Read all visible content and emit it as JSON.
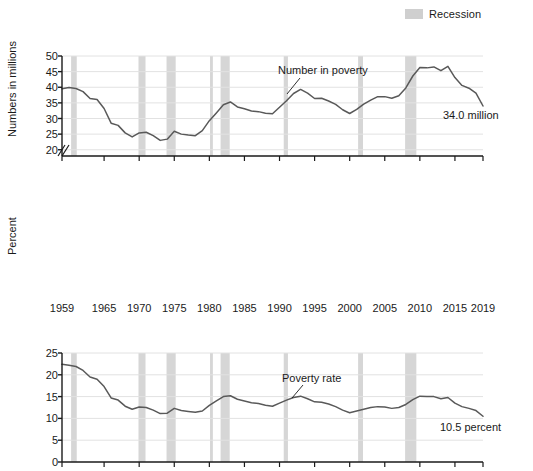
{
  "legend": {
    "label": "Recession",
    "swatch_color": "#cfcfcf"
  },
  "colors": {
    "line": "#595959",
    "recession_band": "#d6d6d6",
    "gridline": "#e2e2e2",
    "axis": "#1a1a1a"
  },
  "panels": {
    "top": {
      "ylabel": "Numbers in millions",
      "yticks": [
        20,
        25,
        30,
        35,
        40,
        45,
        50
      ],
      "series_label": "Number in poverty",
      "end_value_label": "34.0 million",
      "axis_break": true
    },
    "bottom": {
      "ylabel": "Percent",
      "yticks": [
        0,
        5,
        10,
        15,
        20,
        25
      ],
      "series_label": "Poverty rate",
      "end_value_label": "10.5 percent",
      "axis_break": false
    }
  },
  "xaxis": {
    "ticklabels": [
      "1959",
      "1965",
      "1970",
      "1975",
      "1980",
      "1985",
      "1990",
      "1995",
      "2000",
      "2005",
      "2010",
      "2015",
      "2019"
    ],
    "tickvalues": [
      1959,
      1965,
      1970,
      1975,
      1980,
      1985,
      1990,
      1995,
      2000,
      2005,
      2010,
      2015,
      2019
    ],
    "min": 1959,
    "max": 2019
  },
  "chart_data": [
    {
      "type": "line",
      "title": "Number in poverty",
      "xlabel": "",
      "ylabel": "Numbers in millions",
      "xlim": [
        1959,
        2019
      ],
      "ylim": [
        18,
        50
      ],
      "ytick_min": 20,
      "ytick_max": 50,
      "grid": true,
      "legend_position": "top-right",
      "annotations": [
        {
          "text": "Number in poverty",
          "x": 1990,
          "y": 44.5
        },
        {
          "text": "34.0 million",
          "x": 2016,
          "y": 37.5
        }
      ],
      "x": [
        1959,
        1960,
        1961,
        1962,
        1963,
        1964,
        1965,
        1966,
        1967,
        1968,
        1969,
        1970,
        1971,
        1972,
        1973,
        1974,
        1975,
        1976,
        1977,
        1978,
        1979,
        1980,
        1981,
        1982,
        1983,
        1984,
        1985,
        1986,
        1987,
        1988,
        1989,
        1990,
        1991,
        1992,
        1993,
        1994,
        1995,
        1996,
        1997,
        1998,
        1999,
        2000,
        2001,
        2002,
        2003,
        2004,
        2005,
        2006,
        2007,
        2008,
        2009,
        2010,
        2011,
        2012,
        2013,
        2014,
        2015,
        2016,
        2017,
        2018,
        2019
      ],
      "values": [
        39.5,
        39.9,
        39.6,
        38.6,
        36.4,
        36.1,
        33.2,
        28.5,
        27.8,
        25.4,
        24.1,
        25.4,
        25.6,
        24.5,
        23.0,
        23.4,
        25.9,
        25.0,
        24.7,
        24.5,
        26.1,
        29.3,
        31.8,
        34.4,
        35.3,
        33.7,
        33.1,
        32.4,
        32.2,
        31.7,
        31.5,
        33.6,
        35.7,
        38.0,
        39.3,
        38.1,
        36.4,
        36.5,
        35.6,
        34.5,
        32.8,
        31.6,
        32.9,
        34.6,
        35.9,
        37.0,
        37.0,
        36.5,
        37.3,
        39.8,
        43.6,
        46.3,
        46.2,
        46.5,
        45.3,
        46.7,
        43.1,
        40.6,
        39.7,
        38.1,
        34.0
      ]
    },
    {
      "type": "line",
      "title": "Poverty rate",
      "xlabel": "",
      "ylabel": "Percent",
      "xlim": [
        1959,
        2019
      ],
      "ylim": [
        0,
        25
      ],
      "ytick_min": 0,
      "ytick_max": 25,
      "grid": true,
      "annotations": [
        {
          "text": "Poverty rate",
          "x": 1991,
          "y": 17.5
        },
        {
          "text": "10.5 percent",
          "x": 2016,
          "y": 7.6
        }
      ],
      "x": [
        1959,
        1960,
        1961,
        1962,
        1963,
        1964,
        1965,
        1966,
        1967,
        1968,
        1969,
        1970,
        1971,
        1972,
        1973,
        1974,
        1975,
        1976,
        1977,
        1978,
        1979,
        1980,
        1981,
        1982,
        1983,
        1984,
        1985,
        1986,
        1987,
        1988,
        1989,
        1990,
        1991,
        1992,
        1993,
        1994,
        1995,
        1996,
        1997,
        1998,
        1999,
        2000,
        2001,
        2002,
        2003,
        2004,
        2005,
        2006,
        2007,
        2008,
        2009,
        2010,
        2011,
        2012,
        2013,
        2014,
        2015,
        2016,
        2017,
        2018,
        2019
      ],
      "values": [
        22.4,
        22.2,
        21.9,
        21.0,
        19.5,
        19.0,
        17.3,
        14.7,
        14.2,
        12.8,
        12.1,
        12.6,
        12.5,
        11.9,
        11.1,
        11.2,
        12.3,
        11.8,
        11.6,
        11.4,
        11.7,
        13.0,
        14.0,
        15.0,
        15.2,
        14.4,
        14.0,
        13.6,
        13.4,
        13.0,
        12.8,
        13.5,
        14.2,
        14.8,
        15.1,
        14.5,
        13.8,
        13.7,
        13.3,
        12.7,
        11.9,
        11.3,
        11.7,
        12.1,
        12.5,
        12.7,
        12.6,
        12.3,
        12.5,
        13.2,
        14.3,
        15.1,
        15.0,
        15.0,
        14.5,
        14.8,
        13.5,
        12.7,
        12.3,
        11.8,
        10.5
      ]
    }
  ],
  "recessions": [
    {
      "start": 1960.3,
      "end": 1961.1
    },
    {
      "start": 1969.9,
      "end": 1970.9
    },
    {
      "start": 1973.9,
      "end": 1975.2
    },
    {
      "start": 1980.1,
      "end": 1980.5
    },
    {
      "start": 1981.6,
      "end": 1982.9
    },
    {
      "start": 1990.6,
      "end": 1991.2
    },
    {
      "start": 2001.2,
      "end": 2001.9
    },
    {
      "start": 2007.9,
      "end": 2009.5
    }
  ]
}
